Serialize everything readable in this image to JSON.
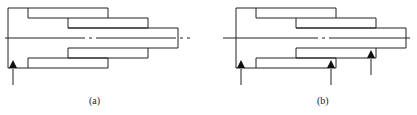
{
  "figure": {
    "panels": [
      {
        "id": "a",
        "caption": "(a)",
        "offset_x": 0,
        "support_arrows": [
          9
        ]
      },
      {
        "id": "b",
        "caption": "(b)",
        "offset_x": 228,
        "support_arrows": [
          9,
          99,
          139
        ]
      }
    ],
    "colors": {
      "line": "#222222",
      "background": "#ffffff"
    }
  }
}
